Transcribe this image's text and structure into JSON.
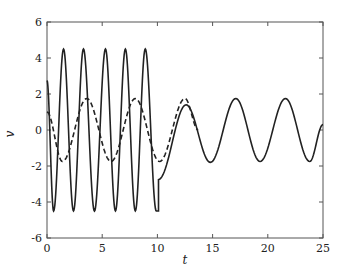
{
  "chart_data": {
    "type": "line",
    "title": "",
    "xlabel": "t",
    "ylabel": "v",
    "xlim": [
      0,
      25
    ],
    "ylim": [
      -6,
      6
    ],
    "xticks": [
      0,
      5,
      10,
      15,
      20,
      25
    ],
    "yticks": [
      -6,
      -4,
      -2,
      0,
      2,
      4,
      6
    ],
    "xtick_labels": [
      "0",
      "5",
      "10",
      "15",
      "20",
      "25"
    ],
    "ytick_labels": [
      "-6",
      "-4",
      "-2",
      "0",
      "2",
      "4",
      "6"
    ],
    "grid": false,
    "legend": null,
    "series": [
      {
        "name": "solid",
        "style": "solid",
        "color": "#222222",
        "description": "Fast oscillation (amplitude ~4.5, period ~1.85) for 0<=t<=10, then jumps to ~-2.75 at t~10.1 and converges to slow oscillation (amplitude ~1.75, period ~4.5)",
        "key_points": [
          {
            "t": 0.0,
            "v": 2.75
          },
          {
            "t": 0.6,
            "v": -4.5
          },
          {
            "t": 1.5,
            "v": 4.5
          },
          {
            "t": 2.4,
            "v": -4.5
          },
          {
            "t": 3.3,
            "v": 4.5
          },
          {
            "t": 4.3,
            "v": -4.5
          },
          {
            "t": 5.3,
            "v": 4.5
          },
          {
            "t": 6.2,
            "v": -4.5
          },
          {
            "t": 7.1,
            "v": 4.5
          },
          {
            "t": 8.0,
            "v": -4.5
          },
          {
            "t": 8.9,
            "v": 4.5
          },
          {
            "t": 9.9,
            "v": -4.5
          },
          {
            "t": 10.1,
            "v": -2.75
          },
          {
            "t": 12.6,
            "v": 1.4
          },
          {
            "t": 14.8,
            "v": -1.8
          },
          {
            "t": 17.1,
            "v": 1.75
          },
          {
            "t": 19.3,
            "v": -1.75
          },
          {
            "t": 21.6,
            "v": 1.75
          },
          {
            "t": 23.8,
            "v": -1.75
          },
          {
            "t": 25.0,
            "v": 0.3
          }
        ]
      },
      {
        "name": "dashed",
        "style": "dashed",
        "color": "#222222",
        "description": "Slow oscillation (amplitude ~1.75, period ~4.4) from t=0 to ~13.7",
        "key_points": [
          {
            "t": 0.0,
            "v": 1.0
          },
          {
            "t": 1.4,
            "v": -1.75
          },
          {
            "t": 3.6,
            "v": 1.75
          },
          {
            "t": 5.8,
            "v": -1.75
          },
          {
            "t": 8.0,
            "v": 1.75
          },
          {
            "t": 10.2,
            "v": -1.75
          },
          {
            "t": 12.5,
            "v": 1.75
          },
          {
            "t": 13.7,
            "v": 0.0
          }
        ]
      }
    ]
  }
}
